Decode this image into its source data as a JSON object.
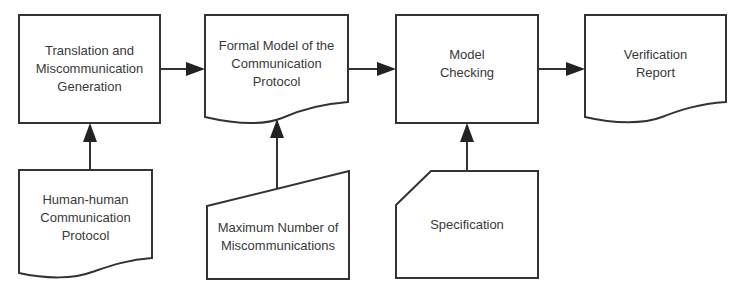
{
  "diagram": {
    "type": "flowchart",
    "nodes": [
      {
        "id": "translation",
        "shape": "process",
        "label": "Translation and\nMiscommunication\nGeneration"
      },
      {
        "id": "formal_model",
        "shape": "document",
        "label": "Formal Model of the\nCommunication\nProtocol"
      },
      {
        "id": "model_checking",
        "shape": "process",
        "label": "Model\nChecking"
      },
      {
        "id": "verification_report",
        "shape": "document",
        "label": "Verification\nReport"
      },
      {
        "id": "human_protocol",
        "shape": "document",
        "label": "Human-human\nCommunication\nProtocol"
      },
      {
        "id": "max_miscomm",
        "shape": "manual-input",
        "label": "Maximum Number of\nMiscommunications"
      },
      {
        "id": "specification",
        "shape": "card",
        "label": "Specification"
      }
    ],
    "edges": [
      {
        "from": "translation",
        "to": "formal_model"
      },
      {
        "from": "formal_model",
        "to": "model_checking"
      },
      {
        "from": "model_checking",
        "to": "verification_report"
      },
      {
        "from": "human_protocol",
        "to": "translation"
      },
      {
        "from": "max_miscomm",
        "to": "formal_model"
      },
      {
        "from": "specification",
        "to": "model_checking"
      }
    ],
    "colors": {
      "stroke": "#333333",
      "text": "#3a3a3a",
      "background": "#ffffff"
    }
  }
}
